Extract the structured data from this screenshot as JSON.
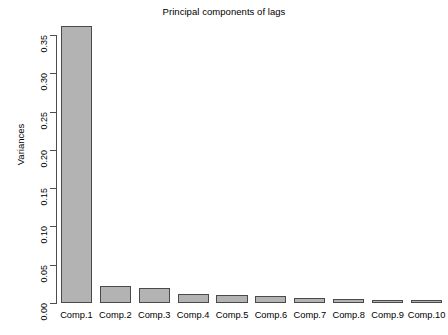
{
  "chart_data": {
    "type": "bar",
    "title": "Principal components of lags",
    "xlabel": "",
    "ylabel": "Variances",
    "categories": [
      "Comp.1",
      "Comp.2",
      "Comp.3",
      "Comp.4",
      "Comp.5",
      "Comp.6",
      "Comp.7",
      "Comp.8",
      "Comp.9",
      "Comp.10"
    ],
    "values": [
      0.362,
      0.0222,
      0.0196,
      0.0118,
      0.0105,
      0.0092,
      0.0065,
      0.0046,
      0.004,
      0.0033
    ],
    "ylim": [
      0.0,
      0.362
    ],
    "y_ticks": [
      0.0,
      0.05,
      0.1,
      0.15,
      0.2,
      0.25,
      0.3,
      0.35
    ],
    "y_tick_labels": [
      "0.00",
      "0.05",
      "0.10",
      "0.15",
      "0.20",
      "0.25",
      "0.30",
      "0.35"
    ],
    "grid": false,
    "legend": null,
    "bar_fill_color": "#b3b3b3",
    "bar_border_color": "#4a4a4a",
    "axis_color": "#4d4d4d",
    "background_color": "#ffffff"
  },
  "chart": {
    "title": "Principal components of lags",
    "y_axis_title": "Variances"
  }
}
